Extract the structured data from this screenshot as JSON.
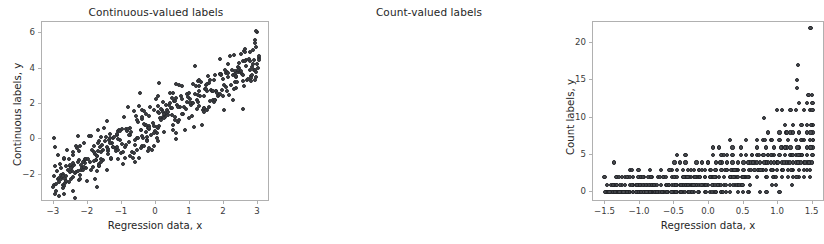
{
  "figure": {
    "width": 559,
    "height": 244,
    "background": "#ffffff",
    "marker_color": "#404247",
    "spine_color": "#b0b0b0",
    "text_color": "#262626"
  },
  "chart_data": [
    {
      "type": "scatter",
      "panel": "left",
      "title": "Continuous-valued labels",
      "xlabel": "Regression data, x",
      "ylabel": "Continuous labels, y",
      "xlim": [
        -3.35,
        3.35
      ],
      "ylim": [
        -3.55,
        6.65
      ],
      "xticks": [
        -3,
        -2,
        -1,
        0,
        1,
        2,
        3
      ],
      "xticklabels": [
        "−3",
        "−2",
        "−1",
        "0",
        "1",
        "2",
        "3"
      ],
      "yticks": [
        -2,
        0,
        2,
        4,
        6
      ],
      "yticklabels": [
        "−2",
        "0",
        "2",
        "4",
        "6"
      ],
      "grid": false,
      "legend": null,
      "marker": "filled-circle",
      "n_points": 400,
      "x": [
        -3.01,
        -2.97,
        -2.95,
        -2.93,
        -2.91,
        -2.89,
        -2.86,
        -2.84,
        -2.82,
        -2.8,
        -2.78,
        -2.76,
        -2.74,
        -2.72,
        -2.7,
        -2.68,
        -2.66,
        -2.64,
        -2.62,
        -2.6,
        -2.57,
        -2.55,
        -2.53,
        -2.5,
        -2.48,
        -2.46,
        -2.44,
        -2.41,
        -2.39,
        -2.37,
        -2.34,
        -2.32,
        -2.29,
        -2.27,
        -2.25,
        -2.22,
        -2.2,
        -2.17,
        -2.15,
        -2.12,
        -2.1,
        -2.07,
        -2.05,
        -2.02,
        -2.0,
        -1.97,
        -1.95,
        -1.92,
        -1.9,
        -1.87,
        -1.85,
        -1.82,
        -1.8,
        -1.77,
        -1.75,
        -1.72,
        -1.7,
        -1.67,
        -1.65,
        -1.62,
        -1.6,
        -1.57,
        -1.55,
        -1.52,
        -1.5,
        -1.47,
        -1.45,
        -1.42,
        -1.4,
        -1.37,
        -1.35,
        -1.32,
        -1.3,
        -1.27,
        -1.25,
        -1.22,
        -1.2,
        -1.17,
        -1.15,
        -1.12,
        -1.1,
        -1.07,
        -1.05,
        -1.02,
        -1.0,
        -0.97,
        -0.95,
        -0.92,
        -0.9,
        -0.87,
        -0.85,
        -0.82,
        -0.8,
        -0.77,
        -0.75,
        -0.72,
        -0.7,
        -0.67,
        -0.65,
        -0.62,
        -0.6,
        -0.57,
        -0.55,
        -0.52,
        -0.5,
        -0.47,
        -0.45,
        -0.42,
        -0.4,
        -0.37,
        -0.35,
        -0.32,
        -0.3,
        -0.27,
        -0.25,
        -0.22,
        -0.2,
        -0.17,
        -0.15,
        -0.12,
        -0.1,
        -0.07,
        -0.05,
        -0.02,
        0.0,
        0.02,
        0.05,
        0.07,
        0.1,
        0.12,
        0.15,
        0.17,
        0.2,
        0.22,
        0.25,
        0.27,
        0.3,
        0.32,
        0.35,
        0.37,
        0.4,
        0.42,
        0.45,
        0.47,
        0.5,
        0.52,
        0.55,
        0.57,
        0.6,
        0.62,
        0.65,
        0.67,
        0.7,
        0.72,
        0.75,
        0.77,
        0.8,
        0.82,
        0.85,
        0.87,
        0.9,
        0.92,
        0.95,
        0.97,
        1.0,
        1.02,
        1.05,
        1.07,
        1.1,
        1.12,
        1.15,
        1.17,
        1.2,
        1.22,
        1.25,
        1.27,
        1.3,
        1.32,
        1.35,
        1.37,
        1.4,
        1.42,
        1.45,
        1.47,
        1.5,
        1.52,
        1.55,
        1.57,
        1.6,
        1.62,
        1.65,
        1.67,
        1.7,
        1.72,
        1.75,
        1.77,
        1.8,
        1.82,
        1.85,
        1.87,
        1.9,
        1.92,
        1.95,
        1.97,
        2.0,
        2.02,
        2.05,
        2.07,
        2.1,
        2.12,
        2.15,
        2.17,
        2.2,
        2.22,
        2.25,
        2.27,
        2.3,
        2.32,
        2.35,
        2.37,
        2.4,
        2.42,
        2.45,
        2.47,
        2.5,
        2.52,
        2.55,
        2.57,
        2.6,
        2.62,
        2.65,
        2.67,
        2.7,
        2.72,
        2.75,
        2.77,
        2.8,
        2.82,
        2.85,
        2.87,
        2.9,
        2.92,
        2.95,
        2.97,
        3.0,
        3.02,
        -2.98,
        -2.7,
        -2.45,
        2.95
      ],
      "y_note": "y approximately 1.1*x + 1.05 + gaussian noise (sd 0.7); three low outliers near x=-3.0,-2.7,-2.45 with y about -3.1,-3.1,-2.9; one high point near x=2.95 with y about 6.1"
    },
    {
      "type": "scatter",
      "panel": "right",
      "title": "Count-valued labels",
      "xlabel": "Regression data, x",
      "ylabel": "Count labels, y",
      "xlim": [
        -1.68,
        1.68
      ],
      "ylim": [
        -1.3,
        22.8
      ],
      "xticks": [
        -1.5,
        -1.0,
        -0.5,
        0.0,
        0.5,
        1.0,
        1.5
      ],
      "xticklabels": [
        "−1.5",
        "−1.0",
        "−0.5",
        "0.0",
        "0.5",
        "1.0",
        "1.5"
      ],
      "yticks": [
        0,
        5,
        10,
        15,
        20
      ],
      "yticklabels": [
        "0",
        "5",
        "10",
        "15",
        "20"
      ],
      "grid": false,
      "legend": null,
      "marker": "filled-circle",
      "n_points": 400,
      "y_note": "integer counts; Poisson with mean increasing exponentially in x. Counts 0-2 dominate for x below 0, rising to 5-13 near x=1.5; notable high points: (1.47,22), (1.29,17), (1.27,15), (1.28,14), (1.44,13), (1.49,13)",
      "points_by_level": {
        "0": [
          -1.49,
          -1.46,
          -1.43,
          -1.4,
          -1.34,
          -1.29,
          -1.25,
          -1.21,
          -1.18,
          -1.14,
          -1.1,
          -1.06,
          -1.02,
          -0.98,
          -0.94,
          -0.9,
          -0.86,
          -0.82,
          -0.78,
          -0.74,
          -0.7,
          -0.66,
          -0.62,
          -0.54,
          -0.5,
          -0.46,
          -0.42,
          -0.38,
          -0.3,
          -0.26,
          -0.22,
          -0.14,
          -0.06,
          0.02,
          0.1,
          0.18,
          0.3,
          0.42,
          0.58,
          0.74,
          1.02
        ],
        "1": [
          -1.42,
          -1.38,
          -1.34,
          -1.26,
          -1.14,
          -1.1,
          -1.06,
          -1.02,
          -0.98,
          -0.94,
          -0.9,
          -0.86,
          -0.78,
          -0.7,
          -0.62,
          -0.58,
          -0.54,
          -0.5,
          -0.46,
          -0.42,
          -0.38,
          -0.34,
          -0.3,
          -0.26,
          -0.22,
          -0.18,
          -0.14,
          -0.1,
          -0.06,
          -0.02,
          0.06,
          0.14,
          0.22,
          0.3,
          0.38,
          0.46
        ],
        "2": [
          -1.34,
          -1.3,
          -1.26,
          -1.22,
          -1.18,
          -1.1,
          -1.02,
          -0.98,
          -0.94,
          -0.86,
          -0.82,
          -0.74,
          -0.66,
          -0.62,
          -0.54,
          -0.5,
          -0.46,
          -0.38,
          -0.34,
          -0.3,
          -0.26,
          -0.22,
          -0.18,
          -0.14,
          -0.06,
          0.02,
          0.06,
          0.14,
          0.22,
          0.3,
          0.38,
          0.5,
          0.58,
          0.7,
          0.82,
          0.94,
          1.06,
          1.14,
          1.22,
          1.3,
          1.38,
          1.46
        ],
        "3": [
          -1.14,
          -1.02,
          -0.86,
          -0.7,
          -0.54,
          -0.46,
          -0.38,
          -0.3,
          -0.22,
          -0.14,
          -0.06,
          0.02,
          0.1,
          0.18,
          0.26,
          0.34,
          0.42,
          0.5,
          0.58,
          0.66,
          0.74,
          0.82,
          0.9,
          0.98,
          1.06,
          1.14,
          1.22,
          1.3,
          1.38
        ],
        "4": [
          -1.38,
          -0.5,
          -0.42,
          -0.34,
          -0.18,
          -0.1,
          -0.02,
          0.1,
          0.18,
          0.26,
          0.34,
          0.42,
          0.5,
          0.58,
          0.66,
          0.74,
          0.82,
          0.9,
          0.98,
          1.06,
          1.14,
          1.22,
          1.3,
          1.38,
          1.46
        ],
        "5": [
          -0.46,
          -0.34,
          0.06,
          0.18,
          0.26,
          0.34,
          0.46,
          0.54,
          0.62,
          0.7,
          0.78,
          0.86,
          0.94,
          1.02,
          1.1,
          1.18,
          1.26,
          1.34,
          1.42,
          1.5
        ],
        "6": [
          0.06,
          0.14,
          0.34,
          0.46,
          0.7,
          0.82,
          0.94,
          1.06,
          1.18,
          1.3,
          1.42,
          1.5
        ],
        "7": [
          0.3,
          0.54,
          0.78,
          0.9,
          1.02,
          1.14,
          1.26,
          1.38,
          1.46
        ],
        "8": [
          0.86,
          1.02,
          1.18,
          1.3,
          1.42,
          1.5
        ],
        "9": [
          1.1,
          1.22,
          1.34,
          1.42,
          1.5
        ],
        "11": [
          0.98,
          1.06,
          1.18,
          1.26,
          1.38,
          1.46,
          1.5
        ],
        "12": [
          1.3,
          1.42,
          1.5
        ],
        "13": [
          1.44,
          1.49
        ],
        "14": [
          1.28
        ],
        "15": [
          1.27
        ],
        "17": [
          1.29
        ],
        "22": [
          1.47
        ]
      }
    }
  ]
}
